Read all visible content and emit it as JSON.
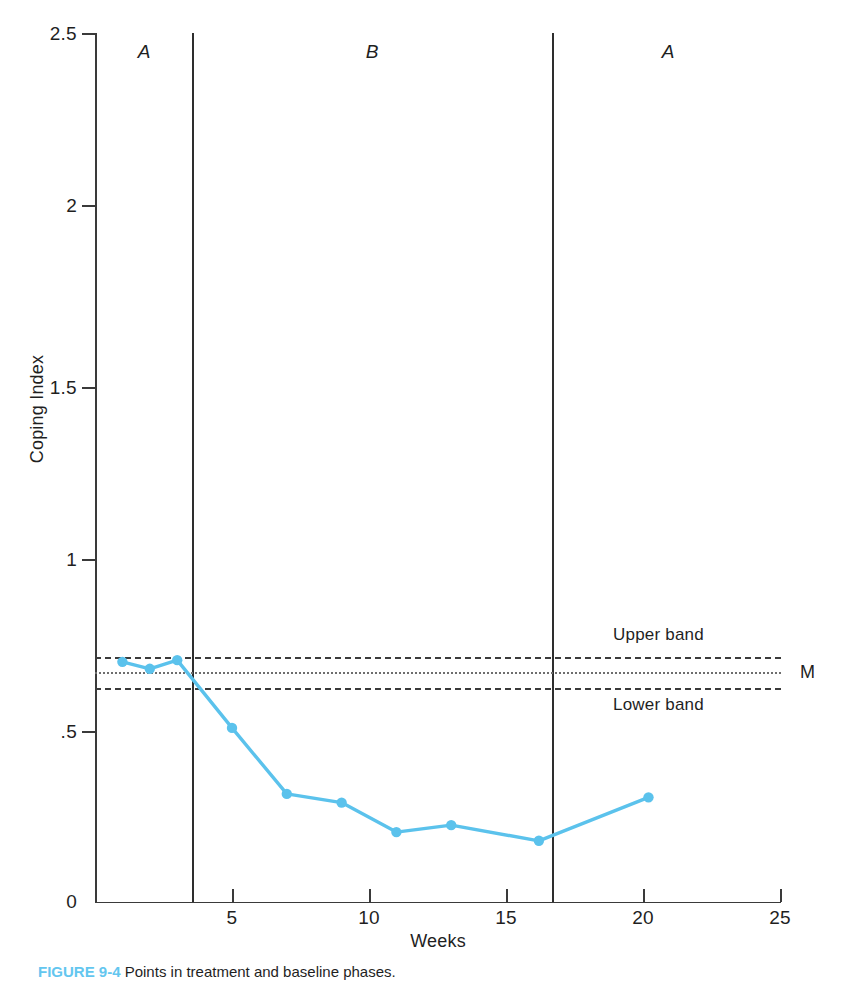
{
  "chart_data": {
    "type": "line",
    "title": "",
    "xlabel": "Weeks",
    "ylabel": "Coping Index",
    "xlim": [
      0,
      25
    ],
    "ylim": [
      0,
      2.5
    ],
    "xticks": [
      5,
      10,
      15,
      20,
      25
    ],
    "yticks": [
      "0",
      ".5",
      "1",
      "1.5",
      "2",
      "2.5"
    ],
    "ytick_values": [
      0,
      0.5,
      1,
      1.5,
      2,
      2.5
    ],
    "grid": false,
    "legend": "none",
    "series": [
      {
        "name": "Coping Index",
        "color": "#5bc2ec",
        "marker": "circle",
        "x": [
          1.0,
          2.0,
          3.0,
          5.0,
          7.0,
          9.0,
          11.0,
          13.0,
          16.2,
          20.2
        ],
        "y": [
          0.69,
          0.67,
          0.695,
          0.5,
          0.31,
          0.285,
          0.2,
          0.22,
          0.175,
          0.3
        ]
      }
    ],
    "reference_lines": [
      {
        "name": "upper-band",
        "label": "Upper band",
        "value": 0.715,
        "style": "dashed",
        "color": "#3b3b3b"
      },
      {
        "name": "mean-line",
        "label": "M",
        "value": 0.67,
        "style": "dotted",
        "color": "#6e6e6e"
      },
      {
        "name": "lower-band",
        "label": "Lower band",
        "value": 0.625,
        "style": "dashed",
        "color": "#3b3b3b"
      }
    ],
    "phase_lines": [
      3.55,
      16.7
    ],
    "phases": [
      {
        "label": "A",
        "center": 1.8
      },
      {
        "label": "B",
        "center": 10.1
      },
      {
        "label": "A",
        "center": 20.9
      }
    ],
    "annotations": [
      {
        "name": "upper-band-caption",
        "text": "Upper band",
        "x": 20.0,
        "y": 0.78
      },
      {
        "name": "lower-band-caption",
        "text": "Lower band",
        "x": 20.0,
        "y": 0.565
      },
      {
        "name": "mean-caption",
        "text": "M",
        "x": 25.8,
        "y": 0.67
      }
    ]
  },
  "axes": {
    "y_label": "Coping Index",
    "x_label": "Weeks",
    "y_tick_labels": [
      "2.5",
      "2",
      "1.5",
      "1",
      ".5",
      "0"
    ],
    "x_tick_labels": [
      "5",
      "10",
      "15",
      "20",
      "25"
    ]
  },
  "phase_labels": {
    "baseline_first": "A",
    "treatment": "B",
    "baseline_second": "A"
  },
  "band_labels": {
    "upper": "Upper band",
    "lower": "Lower band",
    "mean": "M"
  },
  "caption": {
    "number": "FIGURE 9-4",
    "text": "Points in treatment and baseline phases."
  },
  "colors": {
    "series": "#5bc2ec",
    "axis": "#3a3a3a",
    "band": "#3b3b3b",
    "mean": "#6e6e6e",
    "caption_accent": "#63c6ef"
  }
}
